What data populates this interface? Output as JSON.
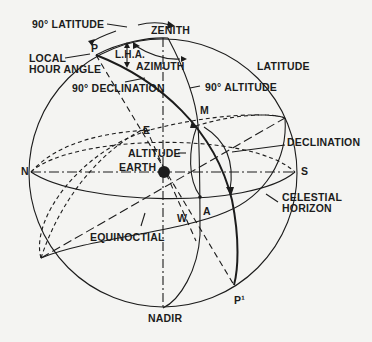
{
  "diagram": {
    "type": "celestial-sphere",
    "colors": {
      "ink": "#1c1c1c",
      "background": "#f4f4f2"
    },
    "labels": {
      "latitude_90": "90° LATITUDE",
      "zenith": "ZENITH",
      "p": "P",
      "lha": "L.H.A.",
      "local": "LOCAL",
      "hour_angle": "HOUR  ANGLE",
      "azimuth": "AZIMUTH",
      "latitude": "LATITUDE",
      "declination_90": "90°  DECLINATION",
      "altitude_90": "90° ALTITUDE",
      "m": "M",
      "e": "E",
      "declination": "DECLINATION",
      "altitude": "ALTITUDE",
      "earth": "EARTH",
      "n": "N",
      "s": "S",
      "celestial": "CELESTIAL",
      "horizon": "HORIZON",
      "a": "A",
      "w": "W",
      "equinoctial": "EQUINOCTIAL",
      "p_prime": "P¹",
      "nadir": "NADIR"
    }
  }
}
